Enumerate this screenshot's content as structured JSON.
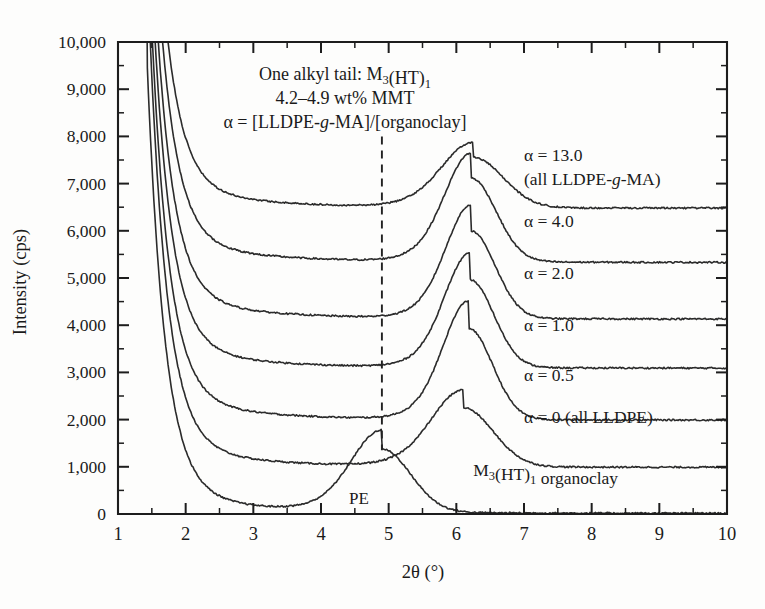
{
  "figure": {
    "background_color": "#fdfdfc",
    "line_color": "#2b2b2b",
    "axis_color": "#1d1d1d"
  },
  "chart_data": {
    "type": "line",
    "title": "",
    "xlabel": "2θ (°)",
    "ylabel": "Intensity (cps)",
    "xlim": [
      1,
      10
    ],
    "ylim": [
      0,
      10000
    ],
    "x_major_ticks": [
      1,
      2,
      3,
      4,
      5,
      6,
      7,
      8,
      9,
      10
    ],
    "x_minor_interval": 0.5,
    "y_major_ticks": [
      0,
      1000,
      2000,
      3000,
      4000,
      5000,
      6000,
      7000,
      8000,
      9000,
      10000
    ],
    "y_tick_labels": [
      "0",
      "1,000",
      "2,000",
      "3,000",
      "4,000",
      "5,000",
      "6,000",
      "7,000",
      "8,000",
      "9,000",
      "10,000"
    ],
    "y_minor_interval": 500,
    "grid": false,
    "legend_position": "inline-right-of-curve",
    "annotations": {
      "header_line1": "One alkyl tail: M3(HT)1",
      "header_line2": "4.2–4.9 wt% MMT",
      "header_line3": "α = [LLDPE-g-MA]/[organoclay]",
      "pe_label": "PE",
      "pe_marker_x": 4.9,
      "dashed_line_x": 4.9,
      "dashed_line_y_range": [
        1350,
        8000
      ]
    },
    "series": [
      {
        "name": "alpha-13",
        "label_line1": "α = 13.0",
        "label_line2": "(all LLDPE-g-MA)",
        "label_x": 7.0,
        "label_y": 7480,
        "baseline": 6500,
        "peak_x": 6.25,
        "peak_y": 7560,
        "peak_width": 0.62,
        "rise_x": 1.45,
        "rise_y": 10000,
        "tail_y": 6480
      },
      {
        "name": "alpha-4",
        "label_line1": "α = 4.0",
        "label_line2": "",
        "label_x": 7.0,
        "label_y": 6080,
        "baseline": 5350,
        "peak_x": 6.22,
        "peak_y": 7120,
        "peak_width": 0.52,
        "rise_x": 1.45,
        "rise_y": 10000,
        "tail_y": 5330
      },
      {
        "name": "alpha-2",
        "label_line1": "α = 2.0",
        "label_line2": "",
        "label_x": 7.0,
        "label_y": 4980,
        "baseline": 4150,
        "peak_x": 6.22,
        "peak_y": 6000,
        "peak_width": 0.5,
        "rise_x": 1.45,
        "rise_y": 10000,
        "tail_y": 4130
      },
      {
        "name": "alpha-1",
        "label_line1": "α = 1.0",
        "label_line2": "",
        "label_x": 7.0,
        "label_y": 3880,
        "baseline": 3100,
        "peak_x": 6.2,
        "peak_y": 4960,
        "peak_width": 0.5,
        "rise_x": 1.45,
        "rise_y": 10000,
        "tail_y": 3090
      },
      {
        "name": "alpha-05",
        "label_line1": "α = 0.5",
        "label_line2": "",
        "label_x": 7.0,
        "label_y": 2810,
        "baseline": 2000,
        "peak_x": 6.18,
        "peak_y": 3930,
        "peak_width": 0.5,
        "rise_x": 1.45,
        "rise_y": 10000,
        "tail_y": 1990
      },
      {
        "name": "alpha-0",
        "label_line1": "α = 0 (all LLDPE)",
        "label_line2": "",
        "label_x": 7.0,
        "label_y": 1930,
        "baseline": 1000,
        "peak_x": 6.1,
        "peak_y": 2250,
        "peak_width": 0.62,
        "rise_x": 1.45,
        "rise_y": 10000,
        "tail_y": 990
      },
      {
        "name": "organoclay",
        "label_line1": "M3(HT)1 organoclay",
        "label_line2": "",
        "label_x": 6.25,
        "label_y": 800,
        "baseline": 20,
        "peak_x": 4.9,
        "peak_y": 1350,
        "peak_width": 0.6,
        "rise_x": 1.42,
        "rise_y": 10000,
        "tail_y": 15
      }
    ]
  }
}
